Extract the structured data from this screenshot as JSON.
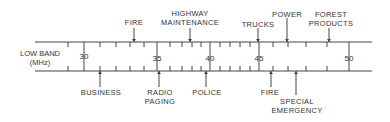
{
  "diagram": {
    "axis_label_line1": "LOW BAND",
    "axis_label_line2": "(MHz)",
    "major_ticks": [
      {
        "value": "30",
        "x": 84
      },
      {
        "value": "35",
        "x": 157
      },
      {
        "value": "40",
        "x": 210
      },
      {
        "value": "45",
        "x": 259
      },
      {
        "value": "50",
        "x": 349
      }
    ],
    "top_allocations": [
      {
        "line1": "FIRE",
        "line2": "",
        "x": 134
      },
      {
        "line1": "HIGHWAY",
        "line2": "MAINTENANCE",
        "x": 190
      },
      {
        "line1": "TRUCKS",
        "line2": "",
        "x": 258
      },
      {
        "line1": "POWER",
        "line2": "",
        "x": 287
      },
      {
        "line1": "FOREST",
        "line2": "PRODUCTS",
        "x": 329
      }
    ],
    "bottom_allocations": [
      {
        "line1": "BUSINESS",
        "line2": "",
        "x": 100
      },
      {
        "line1": "RADIO",
        "line2": "PAGING",
        "x": 159
      },
      {
        "line1": "POLICE",
        "line2": "",
        "x": 206
      },
      {
        "line1": "FIRE",
        "line2": "",
        "x": 271
      },
      {
        "line1": "SPECIAL",
        "line2": "EMERGENCY",
        "x": 296
      }
    ]
  }
}
